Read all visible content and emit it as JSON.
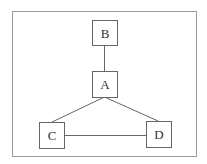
{
  "diagram": {
    "type": "graph",
    "frame": {
      "x": 12,
      "y": 11,
      "w": 184,
      "h": 145
    },
    "nodes": [
      {
        "id": "B",
        "label": "B",
        "x": 92,
        "y": 20,
        "w": 25,
        "h": 25
      },
      {
        "id": "A",
        "label": "A",
        "x": 92,
        "y": 71,
        "w": 25,
        "h": 26
      },
      {
        "id": "C",
        "label": "C",
        "x": 39,
        "y": 122,
        "w": 25,
        "h": 26
      },
      {
        "id": "D",
        "label": "D",
        "x": 146,
        "y": 121,
        "w": 25,
        "h": 26
      }
    ],
    "edges": [
      {
        "from": "B",
        "to": "A"
      },
      {
        "from": "A",
        "to": "C"
      },
      {
        "from": "A",
        "to": "D"
      },
      {
        "from": "C",
        "to": "D"
      }
    ],
    "colors": {
      "stroke": "#555555",
      "frame": "#888888",
      "text": "#333333"
    }
  }
}
